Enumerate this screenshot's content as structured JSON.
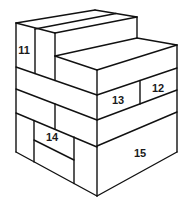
{
  "diagram": {
    "type": "isometric-block-stack",
    "line_color": "#111111",
    "background": "#ffffff",
    "labels": [
      {
        "id": "block-11",
        "text": "11"
      },
      {
        "id": "block-12",
        "text": "12"
      },
      {
        "id": "block-13",
        "text": "13"
      },
      {
        "id": "block-14",
        "text": "14"
      },
      {
        "id": "block-15",
        "text": "15"
      }
    ]
  }
}
